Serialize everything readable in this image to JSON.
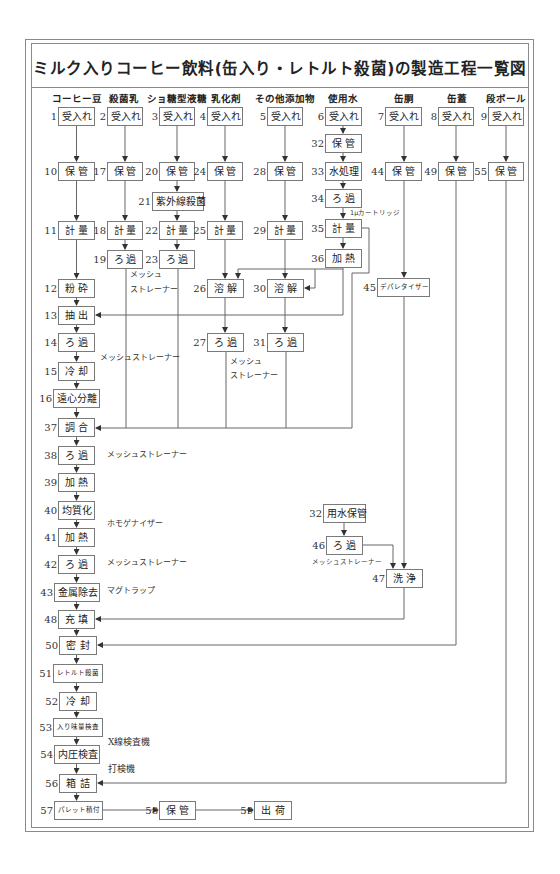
{
  "title": "ミルク入りコーヒー飲料(缶入り・レトルト殺菌)の製造工程一覧図",
  "columns": {
    "coffee_beans": "コーヒー豆",
    "sterilized_milk": "殺菌乳",
    "sucrose_syrup": "ショ糖型液糖",
    "emulsifier": "乳化剤",
    "other_additives": "その他添加物",
    "water": "使用水",
    "can_body": "缶胴",
    "can_lid": "缶蓋",
    "cardboard": "段ボール"
  },
  "steps": {
    "s1": {
      "num": "1",
      "label": "受入れ"
    },
    "s2": {
      "num": "2",
      "label": "受入れ"
    },
    "s3": {
      "num": "3",
      "label": "受入れ"
    },
    "s4": {
      "num": "4",
      "label": "受入れ"
    },
    "s5": {
      "num": "5",
      "label": "受入れ"
    },
    "s6": {
      "num": "6",
      "label": "受入れ"
    },
    "s7": {
      "num": "7",
      "label": "受入れ"
    },
    "s8": {
      "num": "8",
      "label": "受入れ"
    },
    "s9": {
      "num": "9",
      "label": "受入れ"
    },
    "s10": {
      "num": "10",
      "label": "保管"
    },
    "s11": {
      "num": "11",
      "label": "計量"
    },
    "s12": {
      "num": "12",
      "label": "粉砕"
    },
    "s13": {
      "num": "13",
      "label": "抽出"
    },
    "s14": {
      "num": "14",
      "label": "ろ過"
    },
    "s15": {
      "num": "15",
      "label": "冷却"
    },
    "s16": {
      "num": "16",
      "label": "遠心分離"
    },
    "s17": {
      "num": "17",
      "label": "保管"
    },
    "s18": {
      "num": "18",
      "label": "計量"
    },
    "s19": {
      "num": "19",
      "label": "ろ過"
    },
    "s20": {
      "num": "20",
      "label": "保管"
    },
    "s21": {
      "num": "21",
      "label": "紫外線殺菌"
    },
    "s22": {
      "num": "22",
      "label": "計量"
    },
    "s23": {
      "num": "23",
      "label": "ろ過"
    },
    "s24": {
      "num": "24",
      "label": "保管"
    },
    "s25": {
      "num": "25",
      "label": "計量"
    },
    "s26": {
      "num": "26",
      "label": "溶解"
    },
    "s27": {
      "num": "27",
      "label": "ろ過"
    },
    "s28": {
      "num": "28",
      "label": "保管"
    },
    "s29": {
      "num": "29",
      "label": "計量"
    },
    "s30": {
      "num": "30",
      "label": "溶解"
    },
    "s31": {
      "num": "31",
      "label": "ろ過"
    },
    "s32": {
      "num": "32",
      "label": "保管"
    },
    "s33": {
      "num": "33",
      "label": "水処理"
    },
    "s34": {
      "num": "34",
      "label": "ろ過"
    },
    "s35": {
      "num": "35",
      "label": "計量"
    },
    "s36": {
      "num": "36",
      "label": "加熱"
    },
    "s37": {
      "num": "37",
      "label": "調合"
    },
    "s38": {
      "num": "38",
      "label": "ろ過"
    },
    "s39": {
      "num": "39",
      "label": "加熱"
    },
    "s40": {
      "num": "40",
      "label": "均質化"
    },
    "s41": {
      "num": "41",
      "label": "加熱"
    },
    "s42": {
      "num": "42",
      "label": "ろ過"
    },
    "s43": {
      "num": "43",
      "label": "金属除去"
    },
    "s44": {
      "num": "44",
      "label": "保管"
    },
    "s45": {
      "num": "45",
      "label": "デパレタイザー"
    },
    "s32b": {
      "num": "32",
      "label": "用水保管"
    },
    "s46": {
      "num": "46",
      "label": "ろ過"
    },
    "s47": {
      "num": "47",
      "label": "洗浄"
    },
    "s48": {
      "num": "48",
      "label": "充填"
    },
    "s49": {
      "num": "49",
      "label": "保管"
    },
    "s50": {
      "num": "50",
      "label": "密封"
    },
    "s51": {
      "num": "51",
      "label": "レトルト殺菌"
    },
    "s52": {
      "num": "52",
      "label": "冷却"
    },
    "s53": {
      "num": "53",
      "label": "入り味量検査"
    },
    "s54": {
      "num": "54",
      "label": "内圧検査"
    },
    "s55": {
      "num": "55",
      "label": "保管"
    },
    "s56": {
      "num": "56",
      "label": "箱詰"
    },
    "s57": {
      "num": "57",
      "label": "パレット積付"
    },
    "s58": {
      "num": "58",
      "label": "保管"
    },
    "s59": {
      "num": "59",
      "label": "出荷"
    }
  },
  "notes": {
    "s19_mesh": "メッシュ",
    "s19_strainer": "ストレーナー",
    "s14_strainer": "メッシュストレーナー",
    "s27_mesh": "メッシュ",
    "s27_strainer": "ストレーナー",
    "s34_cartridge": "1μカートリッジ",
    "s38_strainer": "メッシュストレーナー",
    "s40_homogenizer": "ホモゲナイザー",
    "s42_strainer": "メッシュストレーナー",
    "s43_magtrap": "マグトラップ",
    "s46_strainer": "メッシュストレーナー",
    "s53_xray": "X線検査機",
    "s54_tapper": "打検機"
  },
  "colors": {
    "line": "#666666",
    "box_border": "#7a7a7a",
    "frame": "#8a8a8a",
    "text": "#222222"
  }
}
